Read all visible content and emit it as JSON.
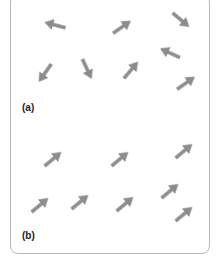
{
  "figure": {
    "arrow_color": "#8c8c8c",
    "border_color": "#b8b8b8",
    "panels": [
      {
        "label": "(a)",
        "description": "randomly oriented arrows",
        "arrows": [
          {
            "x": 55,
            "y": 25,
            "angle": 195
          },
          {
            "x": 122,
            "y": 27,
            "angle": -35
          },
          {
            "x": 181,
            "y": 20,
            "angle": 40
          },
          {
            "x": 170,
            "y": 53,
            "angle": 205
          },
          {
            "x": 45,
            "y": 73,
            "angle": 125
          },
          {
            "x": 87,
            "y": 69,
            "angle": 65
          },
          {
            "x": 131,
            "y": 70,
            "angle": -50
          },
          {
            "x": 186,
            "y": 83,
            "angle": -35
          }
        ]
      },
      {
        "label": "(b)",
        "description": "aligned arrows",
        "arrows": [
          {
            "x": 53,
            "y": 29,
            "angle": -40
          },
          {
            "x": 120,
            "y": 29,
            "angle": -40
          },
          {
            "x": 184,
            "y": 21,
            "angle": -40
          },
          {
            "x": 170,
            "y": 61,
            "angle": -40
          },
          {
            "x": 40,
            "y": 75,
            "angle": -40
          },
          {
            "x": 80,
            "y": 72,
            "angle": -40
          },
          {
            "x": 125,
            "y": 74,
            "angle": -40
          },
          {
            "x": 184,
            "y": 84,
            "angle": -40
          }
        ]
      }
    ]
  }
}
